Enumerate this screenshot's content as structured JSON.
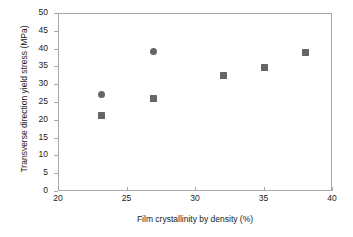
{
  "chart_data": {
    "type": "scatter",
    "title": "",
    "xlabel": "Film crystallinity by density (%)",
    "ylabel": "Transverse direction yield stress (MPa)",
    "xlim": [
      20,
      40
    ],
    "ylim": [
      0,
      50
    ],
    "xticks": [
      20,
      25,
      30,
      35,
      40
    ],
    "yticks": [
      0,
      5,
      10,
      15,
      20,
      25,
      30,
      35,
      40,
      45,
      50
    ],
    "grid": false,
    "legend": "none",
    "marker_color": "#666666",
    "axis_color": "#a8a8a8",
    "series": [
      {
        "name": "circle-series",
        "marker": "circle",
        "color": "#666666",
        "points": [
          {
            "x": 23.1,
            "y": 27.5
          },
          {
            "x": 26.9,
            "y": 39.5
          }
        ]
      },
      {
        "name": "square-series",
        "marker": "square",
        "color": "#666666",
        "points": [
          {
            "x": 23.1,
            "y": 21.5
          },
          {
            "x": 26.9,
            "y": 26.3
          },
          {
            "x": 32.0,
            "y": 32.7
          },
          {
            "x": 35.0,
            "y": 35.0
          },
          {
            "x": 38.0,
            "y": 39.3
          }
        ]
      }
    ]
  }
}
